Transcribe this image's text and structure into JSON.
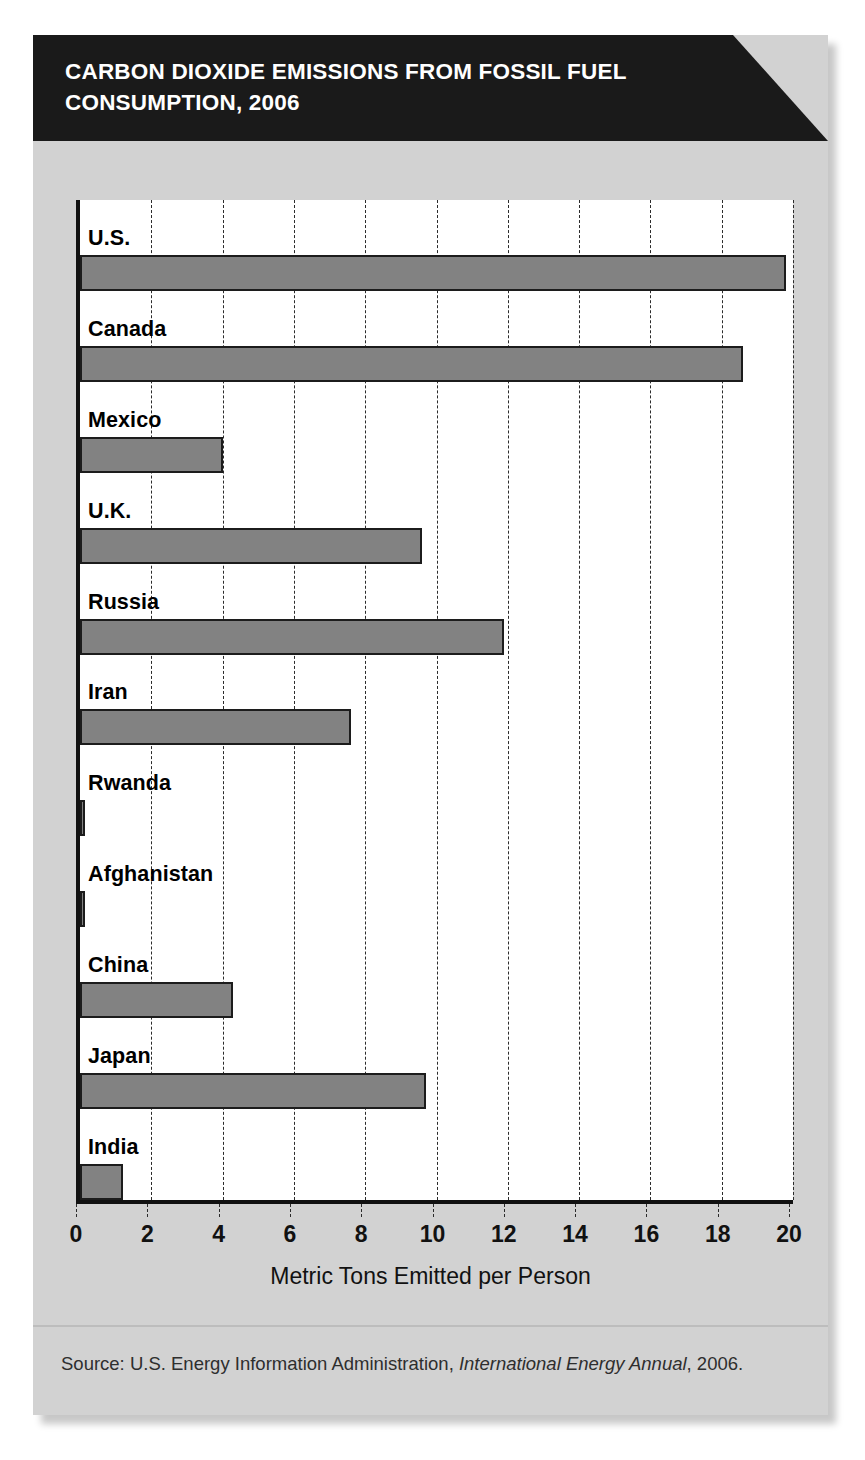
{
  "title": "CARBON DIOXIDE EMISSIONS FROM FOSSIL FUEL CONSUMPTION, 2006",
  "source": {
    "prefix": "Source: U.S. Energy Information Administration,",
    "publication": "International Energy Annual",
    "suffix": ", 2006."
  },
  "colors": {
    "banner": "#1a1a1a",
    "card": "#d2d2d2",
    "plot_background": "#ffffff",
    "bar_fill": "#828282",
    "bar_outline": "#1c1c1c",
    "axis": "#111111",
    "gridline": "#2b2b2b",
    "title_text": "#ffffff"
  },
  "chart_data": {
    "type": "bar",
    "orientation": "horizontal",
    "title": "CARBON DIOXIDE EMISSIONS FROM FOSSIL FUEL CONSUMPTION, 2006",
    "xlabel": "Metric Tons Emitted per Person",
    "ylabel": "",
    "xlim": [
      0,
      20
    ],
    "xticks": [
      0,
      2,
      4,
      6,
      8,
      10,
      12,
      14,
      16,
      18,
      20
    ],
    "xtick_labels": [
      "0",
      "2",
      "4",
      "6",
      "8",
      "10",
      "12",
      "14",
      "16",
      "18",
      "20"
    ],
    "grid": "vertical-dashed",
    "legend": "none",
    "categories": [
      "U.S.",
      "Canada",
      "Mexico",
      "U.K.",
      "Russia",
      "Iran",
      "Rwanda",
      "Afghanistan",
      "China",
      "Japan",
      "India"
    ],
    "values": [
      19.8,
      18.6,
      4.0,
      9.6,
      11.9,
      7.6,
      0.1,
      0.1,
      4.3,
      9.7,
      1.2
    ],
    "units": "metric tons of CO2 per person"
  }
}
